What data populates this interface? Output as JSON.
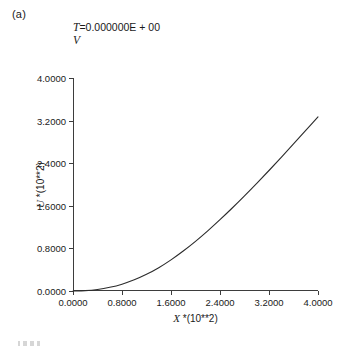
{
  "panel": {
    "label": "(a)"
  },
  "title": {
    "variable": "T",
    "equals": "=",
    "value": "0.000000E + 00",
    "line2": "V",
    "full": "T = 0.000000E + 00"
  },
  "axes": {
    "x": {
      "variable": "X",
      "scale_text": "*(10**2)",
      "label": "X *(10**2)",
      "min": 0.0,
      "max": 4.0,
      "ticks": [
        0.0,
        0.8,
        1.6,
        2.4,
        3.2,
        4.0
      ],
      "tick_labels": [
        "0.0000",
        "0.8000",
        "1.6000",
        "2.4000",
        "3.2000",
        "4.0000"
      ]
    },
    "y": {
      "variable": "U",
      "scale_text": "*(10**2)",
      "label": "U *(10**2)",
      "min": 0.0,
      "max": 4.0,
      "ticks": [
        0.0,
        0.8,
        1.6,
        2.4,
        3.2,
        4.0
      ],
      "tick_labels": [
        "0.0000",
        "0.8000",
        "1.6000",
        "2.4000",
        "3.2000",
        "4.0000"
      ]
    }
  },
  "style": {
    "curve_color": "#2b2b2b",
    "axis_color": "#3d3d3d",
    "background": "#ffffff",
    "curve_width": 1.1
  },
  "chart_data": {
    "type": "line",
    "subtitle": "V",
    "xlabel": "X *(10**2)",
    "ylabel": "U *(10**2)",
    "xlim": [
      0.0,
      4.0
    ],
    "ylim": [
      0.0,
      4.0
    ],
    "grid": false,
    "legend": null,
    "annotations": [
      "(a)"
    ],
    "series": [
      {
        "name": "U(X)",
        "x": [
          0.0,
          0.2,
          0.4,
          0.6,
          0.8,
          1.0,
          1.2,
          1.4,
          1.6,
          1.8,
          2.0,
          2.2,
          2.4,
          2.6,
          2.8,
          3.0,
          3.2,
          3.4,
          3.6,
          3.8,
          4.0
        ],
        "y": [
          0.0,
          0.004,
          0.018,
          0.044,
          0.082,
          0.134,
          0.2,
          0.28,
          0.374,
          0.48,
          0.596,
          0.722,
          0.856,
          0.996,
          1.142,
          1.292,
          1.446,
          1.604,
          1.764,
          1.926,
          2.09
        ]
      }
    ],
    "note": "Monotonic curve: flat (quadratic) onset at the origin, steepening to a near-linear slope; reaches approximately 3.27 at x = 4.0000 in plotted axis units."
  }
}
